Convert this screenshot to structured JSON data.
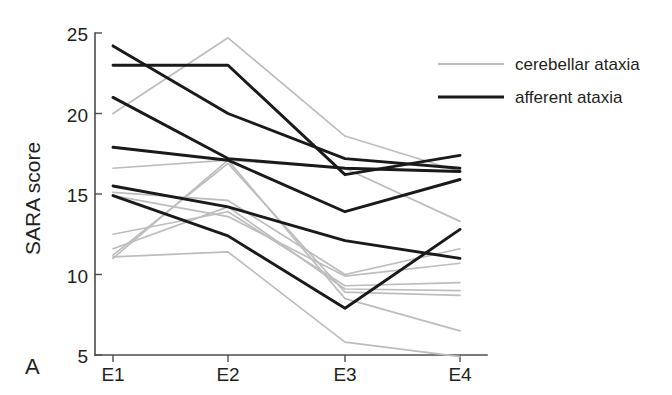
{
  "figure": {
    "panel_label": "A",
    "background_color": "#ffffff"
  },
  "colors": {
    "cerebellar": "#bdbdbd",
    "afferent": "#1a1a1a",
    "axis": "#4d4d4d",
    "text": "#231f20"
  },
  "legend": {
    "position": "top-right",
    "entries": [
      {
        "label": "cerebellar ataxia",
        "color": "#bdbdbd",
        "style": "thin-gray-line"
      },
      {
        "label": "afferent ataxia",
        "color": "#1a1a1a",
        "style": "thick-black-line"
      }
    ]
  },
  "chart_data": {
    "type": "line",
    "title": "",
    "subtitle": "",
    "xlabel": "",
    "ylabel": "SARA score",
    "categories": [
      "E1",
      "E2",
      "E3",
      "E4"
    ],
    "x": [
      1,
      2,
      3,
      4
    ],
    "xlim": [
      0.78,
      4.12
    ],
    "ylim": [
      5,
      25
    ],
    "yticks": [
      5,
      10,
      15,
      20,
      25
    ],
    "xticklabels": [
      "E1",
      "E2",
      "E3",
      "E4"
    ],
    "grid": false,
    "legend_position": "top-right",
    "annotations": [
      "A"
    ],
    "series": [
      {
        "name": "cerebellar ataxia 1",
        "group": "cerebellar",
        "color": "#bdbdbd",
        "values": [
          20.0,
          24.7,
          18.6,
          16.4
        ]
      },
      {
        "name": "cerebellar ataxia 2",
        "group": "cerebellar",
        "color": "#bdbdbd",
        "values": [
          16.6,
          17.1,
          16.6,
          13.3
        ]
      },
      {
        "name": "cerebellar ataxia 3",
        "group": "cerebellar",
        "color": "#bdbdbd",
        "values": [
          15.1,
          14.6,
          10.0,
          11.6
        ]
      },
      {
        "name": "cerebellar ataxia 4",
        "group": "cerebellar",
        "color": "#bdbdbd",
        "values": [
          14.9,
          13.6,
          9.9,
          10.7
        ]
      },
      {
        "name": "cerebellar ataxia 5",
        "group": "cerebellar",
        "color": "#bdbdbd",
        "values": [
          12.5,
          13.9,
          9.3,
          9.5
        ]
      },
      {
        "name": "cerebellar ataxia 6",
        "group": "cerebellar",
        "color": "#bdbdbd",
        "values": [
          11.6,
          14.2,
          9.1,
          9.0
        ]
      },
      {
        "name": "cerebellar ataxia 7",
        "group": "cerebellar",
        "color": "#bdbdbd",
        "values": [
          11.2,
          16.9,
          8.9,
          8.7
        ]
      },
      {
        "name": "cerebellar ataxia 8",
        "group": "cerebellar",
        "color": "#bdbdbd",
        "values": [
          11.0,
          17.1,
          8.5,
          6.5
        ]
      },
      {
        "name": "cerebellar ataxia 9",
        "group": "cerebellar",
        "color": "#bdbdbd",
        "values": [
          11.1,
          11.4,
          5.8,
          4.9
        ]
      },
      {
        "name": "afferent ataxia 1",
        "group": "afferent",
        "color": "#1a1a1a",
        "values": [
          24.2,
          20.0,
          17.2,
          16.6
        ]
      },
      {
        "name": "afferent ataxia 2",
        "group": "afferent",
        "color": "#1a1a1a",
        "values": [
          23.0,
          23.0,
          16.2,
          17.4
        ]
      },
      {
        "name": "afferent ataxia 3",
        "group": "afferent",
        "color": "#1a1a1a",
        "values": [
          21.0,
          17.2,
          16.6,
          16.4
        ]
      },
      {
        "name": "afferent ataxia 4",
        "group": "afferent",
        "color": "#1a1a1a",
        "values": [
          17.9,
          17.1,
          13.9,
          15.9
        ]
      },
      {
        "name": "afferent ataxia 5",
        "group": "afferent",
        "color": "#1a1a1a",
        "values": [
          15.5,
          14.2,
          12.1,
          11.0
        ]
      },
      {
        "name": "afferent ataxia 6",
        "group": "afferent",
        "color": "#1a1a1a",
        "values": [
          14.9,
          12.4,
          7.9,
          12.8
        ]
      }
    ]
  }
}
